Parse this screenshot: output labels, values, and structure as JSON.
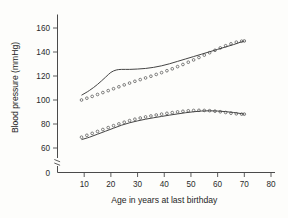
{
  "figure": {
    "background_color": "#fdfdfb",
    "ink_color": "#3a3a3a"
  },
  "chart_data": {
    "type": "line",
    "title": "",
    "xlabel": "Age in years at last birthday",
    "ylabel": "Blood pressure (mmHg)",
    "xlim": [
      0,
      80
    ],
    "ylim": [
      60,
      170
    ],
    "y_axis_break": true,
    "y_zero_label": "0",
    "grid": false,
    "legend": "none",
    "xticks": [
      10,
      20,
      30,
      40,
      50,
      60,
      70,
      80
    ],
    "xtick_labels": [
      "10",
      "20",
      "30",
      "40",
      "50",
      "60",
      "70",
      "80"
    ],
    "yticks": [
      60,
      80,
      100,
      120,
      140,
      160
    ],
    "ytick_labels": [
      "60",
      "80",
      "100",
      "120",
      "140",
      "160"
    ],
    "series": [
      {
        "name": "Systolic - solid line",
        "style": "solid",
        "x": [
          9,
          12,
          15,
          18,
          20,
          22,
          24,
          27,
          30,
          33,
          36,
          39,
          42,
          45,
          48,
          51,
          54,
          57,
          60,
          63,
          66,
          69,
          70
        ],
        "values": [
          104,
          108,
          113,
          119,
          123,
          125,
          125.5,
          125.5,
          125.8,
          126.3,
          127.2,
          128.5,
          130.2,
          132.2,
          134.2,
          136.2,
          138.2,
          140.2,
          142.2,
          144.2,
          146.2,
          148.5,
          149
        ]
      },
      {
        "name": "Systolic - circle markers",
        "style": "dotted-circles",
        "x": [
          9,
          11,
          13,
          15,
          17,
          19,
          21,
          23,
          25,
          27,
          29,
          31,
          33,
          35,
          37,
          39,
          41,
          43,
          45,
          47,
          49,
          51,
          53,
          55,
          57,
          59,
          61,
          63,
          65,
          67,
          69,
          70
        ],
        "values": [
          100,
          101.5,
          103,
          104.6,
          106.2,
          107.8,
          109.4,
          111,
          112.6,
          114.1,
          115.6,
          117,
          118.4,
          119.8,
          121.3,
          122.8,
          124.4,
          126,
          127.8,
          129.6,
          131.5,
          133.4,
          135.4,
          137.4,
          139.4,
          141.4,
          143.4,
          145.2,
          146.8,
          148.2,
          149,
          149.2
        ]
      },
      {
        "name": "Diastolic - solid line",
        "style": "solid",
        "x": [
          9,
          12,
          15,
          18,
          21,
          24,
          27,
          30,
          33,
          36,
          39,
          42,
          45,
          48,
          51,
          54,
          57,
          60,
          63,
          66,
          69,
          70
        ],
        "values": [
          67,
          69,
          71.5,
          74,
          76.5,
          79,
          81,
          82.6,
          84,
          85.2,
          86.3,
          87.4,
          88.4,
          89.4,
          90.2,
          90.8,
          91,
          90.8,
          90.3,
          89.6,
          88.6,
          88.2
        ]
      },
      {
        "name": "Diastolic - circle markers",
        "style": "dotted-circles",
        "x": [
          9,
          11,
          13,
          15,
          17,
          19,
          21,
          23,
          25,
          27,
          29,
          31,
          33,
          35,
          37,
          39,
          41,
          43,
          45,
          47,
          49,
          51,
          53,
          55,
          57,
          59,
          61,
          63,
          65,
          67,
          69,
          70
        ],
        "values": [
          69,
          70.6,
          72.2,
          73.8,
          75.4,
          77,
          78.6,
          80.1,
          81.5,
          82.8,
          84,
          85,
          85.9,
          86.7,
          87.5,
          88.2,
          88.9,
          89.5,
          90.1,
          90.6,
          91,
          91.3,
          91.4,
          91.3,
          91.1,
          90.7,
          90.2,
          89.6,
          89,
          88.5,
          88.2,
          88.2
        ]
      }
    ]
  }
}
